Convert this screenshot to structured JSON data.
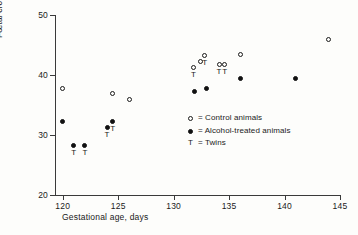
{
  "chart_data": {
    "type": "scatter",
    "title": "",
    "xlabel": "Gestational age, days",
    "ylabel": "Fœtal crown-rump length, cm",
    "xlim": [
      119.3,
      145.0
    ],
    "ylim": [
      20,
      50
    ],
    "xticks": [
      120,
      125,
      130,
      135,
      140,
      145
    ],
    "yticks": [
      20,
      30,
      40,
      50
    ],
    "grid": false,
    "legend_position": "center-right-inside",
    "series": [
      {
        "name": "Control animals",
        "marker": "open-circle",
        "points": [
          {
            "x": 120.0,
            "y": 37.7,
            "twin": false
          },
          {
            "x": 124.5,
            "y": 36.9,
            "twin": false
          },
          {
            "x": 126.0,
            "y": 36.0,
            "twin": false
          },
          {
            "x": 131.8,
            "y": 41.3,
            "twin": true
          },
          {
            "x": 132.4,
            "y": 42.2,
            "twin": false
          },
          {
            "x": 132.8,
            "y": 43.3,
            "twin": true
          },
          {
            "x": 134.1,
            "y": 41.8,
            "twin": true
          },
          {
            "x": 134.6,
            "y": 41.8,
            "twin": true
          },
          {
            "x": 136.0,
            "y": 43.5,
            "twin": false
          },
          {
            "x": 144.0,
            "y": 45.9,
            "twin": false
          }
        ]
      },
      {
        "name": "Alcohol-treated animals",
        "marker": "filled-circle",
        "points": [
          {
            "x": 120.0,
            "y": 32.3,
            "twin": false
          },
          {
            "x": 121.0,
            "y": 28.2,
            "twin": true
          },
          {
            "x": 122.0,
            "y": 28.3,
            "twin": true
          },
          {
            "x": 124.0,
            "y": 31.2,
            "twin": true
          },
          {
            "x": 124.5,
            "y": 32.3,
            "twin": true
          },
          {
            "x": 131.9,
            "y": 37.2,
            "twin": false
          },
          {
            "x": 133.0,
            "y": 37.7,
            "twin": false
          },
          {
            "x": 136.0,
            "y": 39.5,
            "twin": false
          },
          {
            "x": 141.0,
            "y": 39.5,
            "twin": false
          }
        ]
      }
    ],
    "annotations": {
      "twin_symbol": "T",
      "twin_meaning": "Twins"
    }
  },
  "legend": {
    "rows": [
      {
        "key": "open-circle",
        "label": "= Control animals"
      },
      {
        "key": "filled-circle",
        "label": "= Alcohol-treated animals"
      },
      {
        "key": "T",
        "label": "= Twins"
      }
    ]
  },
  "axes": {
    "y_title": "Fœtal crown-rump length, cm",
    "x_title": "Gestational age, days",
    "y_tick_labels": [
      "50",
      "40",
      "30",
      "20"
    ],
    "x_tick_labels": [
      "120",
      "125",
      "130",
      "135",
      "140",
      "145"
    ]
  },
  "colors": {
    "marker": "#111111",
    "axis": "#3a3a3a",
    "text": "#1a1a1a",
    "background": "#fdfdfb"
  }
}
